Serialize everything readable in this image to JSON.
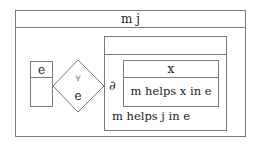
{
  "diagram": {
    "outer_box": {
      "header": "m j"
    },
    "left_box": {
      "header": "e",
      "body": ""
    },
    "quantifier": {
      "symbol": "∀",
      "variable": "e"
    },
    "right_box": {
      "header": "",
      "operator": "∂",
      "inner_box": {
        "header": "x",
        "condition": "m helps x in e"
      },
      "condition": "m helps j in e"
    }
  },
  "colors": {
    "line": "#7a7a7a",
    "text": "#222222"
  }
}
